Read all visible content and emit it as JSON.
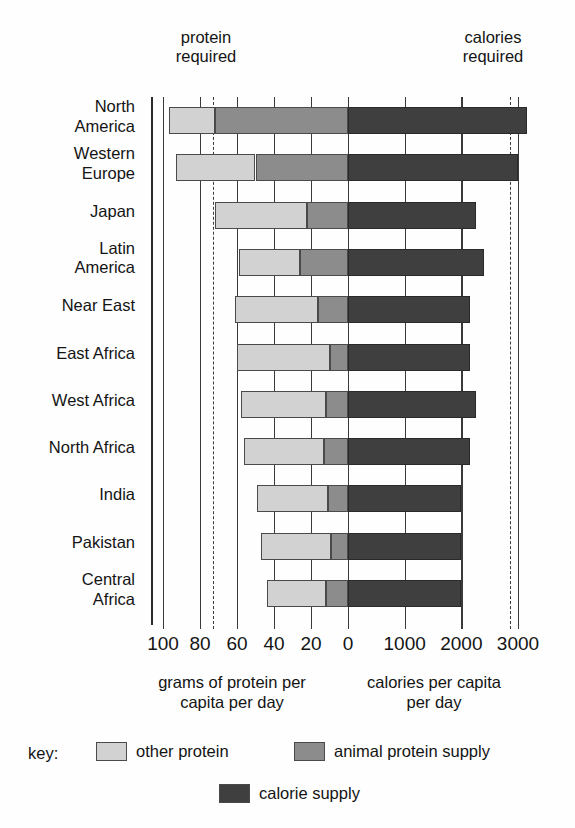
{
  "chart_data": {
    "type": "bar",
    "orientation": "horizontal",
    "title": "",
    "annotations": [
      {
        "name": "protein-required",
        "text": "protein\nrequired",
        "value": 73,
        "axis": "protein"
      },
      {
        "name": "calories-required",
        "text": "calories\nrequired",
        "value": 2850,
        "axis": "calories"
      }
    ],
    "categories": [
      "North\nAmerica",
      "Western\nEurope",
      "Japan",
      "Latin\nAmerica",
      "Near East",
      "East Africa",
      "West Africa",
      "North Africa",
      "India",
      "Pakistan",
      "Central\nAfrica"
    ],
    "series": [
      {
        "name": "other protein",
        "axis": "protein",
        "color": "#d2d2d2",
        "values": [
          25,
          43,
          50,
          33,
          45,
          50,
          46,
          43,
          38,
          38,
          32
        ]
      },
      {
        "name": "animal protein supply",
        "axis": "protein",
        "color": "#8c8c8c",
        "values": [
          72,
          50,
          22,
          26,
          16,
          10,
          12,
          13,
          11,
          9,
          12
        ]
      },
      {
        "name": "calorie supply",
        "axis": "calories",
        "color": "#3f3f3f",
        "values": [
          3150,
          3000,
          2250,
          2400,
          2150,
          2150,
          2250,
          2150,
          2000,
          2000,
          2000
        ]
      }
    ],
    "left_axis": {
      "label": "grams of protein per\ncapita per day",
      "ticks": [
        100,
        80,
        60,
        40,
        20,
        0
      ],
      "max": 100,
      "direction": "right-to-left"
    },
    "right_axis": {
      "label": "calories per capita\nper day",
      "ticks": [
        0,
        1000,
        2000,
        3000
      ],
      "max": 3000,
      "direction": "left-to-right"
    },
    "grid": true,
    "legend_position": "bottom",
    "legend_prefix": "key:"
  },
  "legend": {
    "prefix": "key:",
    "items": [
      {
        "label": "other protein",
        "color": "#d2d2d2"
      },
      {
        "label": "animal protein supply",
        "color": "#8c8c8c"
      },
      {
        "label": "calorie supply",
        "color": "#3f3f3f"
      }
    ]
  }
}
